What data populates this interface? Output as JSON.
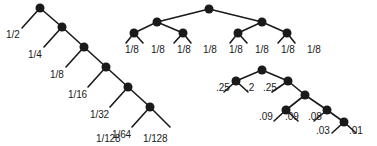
{
  "figure": {
    "name": "three-binary-code-trees-with-leaf-probabilities",
    "background_color": "#ffffff",
    "node_color": "#1a1a1a",
    "edge_color": "#1a1a1a",
    "text_color": "#1a1a1a",
    "width": 377,
    "height": 146
  },
  "trees": [
    {
      "id": "left-tree",
      "name": "unbalanced-skewed-tree",
      "nodes": [
        {
          "id": "L0",
          "x": 40,
          "y": 8,
          "r": 4.5
        },
        {
          "id": "L1",
          "x": 62,
          "y": 27,
          "r": 4.5
        },
        {
          "id": "L2",
          "x": 84,
          "y": 47,
          "r": 4.5
        },
        {
          "id": "L3",
          "x": 106,
          "y": 67,
          "r": 4.5
        },
        {
          "id": "L4",
          "x": 128,
          "y": 87,
          "r": 4.5
        },
        {
          "id": "L5",
          "x": 150,
          "y": 107,
          "r": 4.5
        }
      ],
      "edges": [
        {
          "from": "L0",
          "to": [
            22,
            28
          ]
        },
        {
          "from": "L0",
          "to": "L1"
        },
        {
          "from": "L1",
          "to": [
            44,
            47
          ]
        },
        {
          "from": "L1",
          "to": "L2"
        },
        {
          "from": "L2",
          "to": [
            66,
            67
          ]
        },
        {
          "from": "L2",
          "to": "L3"
        },
        {
          "from": "L3",
          "to": [
            88,
            87
          ]
        },
        {
          "from": "L3",
          "to": "L4"
        },
        {
          "from": "L4",
          "to": [
            110,
            107
          ]
        },
        {
          "from": "L4",
          "to": "L5"
        },
        {
          "from": "L5",
          "to": [
            132,
            127
          ]
        },
        {
          "from": "L5",
          "to": [
            170,
            127
          ]
        }
      ],
      "leaf_labels": [
        {
          "text": "1/2",
          "x": 6,
          "y": 29
        },
        {
          "text": "1/4",
          "x": 28,
          "y": 49
        },
        {
          "text": "1/8",
          "x": 50,
          "y": 69
        },
        {
          "text": "1/16",
          "x": 68,
          "y": 89
        },
        {
          "text": "1/32",
          "x": 90,
          "y": 109
        },
        {
          "text": "1/64",
          "x": 112,
          "y": 129
        },
        {
          "text": "1/128",
          "x": 96,
          "y": 133
        },
        {
          "text": "1/128",
          "x": 143,
          "y": 133
        }
      ]
    },
    {
      "id": "middle-tree",
      "name": "balanced-uniform-tree",
      "nodes": [
        {
          "id": "M0",
          "x": 209,
          "y": 9,
          "r": 4.5
        },
        {
          "id": "M1",
          "x": 157,
          "y": 22,
          "r": 4.5
        },
        {
          "id": "M2",
          "x": 262,
          "y": 22,
          "r": 4.5
        },
        {
          "id": "M3",
          "x": 134,
          "y": 33,
          "r": 4.5
        },
        {
          "id": "M4",
          "x": 183,
          "y": 33,
          "r": 4.5
        },
        {
          "id": "M5",
          "x": 238,
          "y": 33,
          "r": 4.5
        },
        {
          "id": "M6",
          "x": 287,
          "y": 33,
          "r": 4.5
        }
      ],
      "edges": [
        {
          "from": "M0",
          "to": "M1"
        },
        {
          "from": "M0",
          "to": "M2"
        },
        {
          "from": "M1",
          "to": "M3"
        },
        {
          "from": "M1",
          "to": "M4"
        },
        {
          "from": "M2",
          "to": "M5"
        },
        {
          "from": "M2",
          "to": "M6"
        },
        {
          "from": "M3",
          "to": [
            126,
            43
          ]
        },
        {
          "from": "M3",
          "to": [
            143,
            43
          ]
        },
        {
          "from": "M4",
          "to": [
            174,
            43
          ]
        },
        {
          "from": "M4",
          "to": [
            191,
            43
          ]
        },
        {
          "from": "M5",
          "to": [
            230,
            43
          ]
        },
        {
          "from": "M5",
          "to": [
            247,
            43
          ]
        },
        {
          "from": "M6",
          "to": [
            278,
            43
          ]
        },
        {
          "from": "M6",
          "to": [
            295,
            43
          ]
        }
      ],
      "leaf_labels": [
        {
          "text": "1/8",
          "x": 125,
          "y": 44
        },
        {
          "text": "1/8",
          "x": 151,
          "y": 44
        },
        {
          "text": "1/8",
          "x": 177,
          "y": 44
        },
        {
          "text": "1/8",
          "x": 203,
          "y": 44
        },
        {
          "text": "1/8",
          "x": 229,
          "y": 44
        },
        {
          "text": "1/8",
          "x": 255,
          "y": 44
        },
        {
          "text": "1/8",
          "x": 281,
          "y": 44
        },
        {
          "text": "1/8",
          "x": 307,
          "y": 44
        }
      ]
    },
    {
      "id": "right-tree",
      "name": "mixed-probability-tree",
      "nodes": [
        {
          "id": "R0",
          "x": 262,
          "y": 70,
          "r": 4.5
        },
        {
          "id": "R1",
          "x": 236,
          "y": 81,
          "r": 4.5
        },
        {
          "id": "R2",
          "x": 288,
          "y": 81,
          "r": 4.5
        },
        {
          "id": "R3",
          "x": 305,
          "y": 95,
          "r": 4.5
        },
        {
          "id": "R4",
          "x": 286,
          "y": 110,
          "r": 4.5
        },
        {
          "id": "R5",
          "x": 327,
          "y": 110,
          "r": 4.5
        },
        {
          "id": "R6",
          "x": 344,
          "y": 122,
          "r": 4.5
        }
      ],
      "edges": [
        {
          "from": "R0",
          "to": "R1"
        },
        {
          "from": "R0",
          "to": "R2"
        },
        {
          "from": "R1",
          "to": [
            224,
            92
          ]
        },
        {
          "from": "R1",
          "to": [
            248,
            92
          ]
        },
        {
          "from": "R2",
          "to": [
            272,
            92
          ]
        },
        {
          "from": "R2",
          "to": "R3"
        },
        {
          "from": "R3",
          "to": "R4"
        },
        {
          "from": "R3",
          "to": "R5"
        },
        {
          "from": "R4",
          "to": [
            274,
            121
          ]
        },
        {
          "from": "R4",
          "to": [
            298,
            121
          ]
        },
        {
          "from": "R5",
          "to": [
            314,
            121
          ]
        },
        {
          "from": "R5",
          "to": "R6"
        },
        {
          "from": "R6",
          "to": [
            332,
            133
          ]
        },
        {
          "from": "R6",
          "to": [
            356,
            133
          ]
        }
      ],
      "leaf_labels": [
        {
          "text": ".25",
          "x": 216,
          "y": 82
        },
        {
          "text": ".2",
          "x": 246,
          "y": 82
        },
        {
          "text": ".25",
          "x": 263,
          "y": 82
        },
        {
          "text": ".09",
          "x": 259,
          "y": 111
        },
        {
          "text": ".09",
          "x": 285,
          "y": 111
        },
        {
          "text": ".08",
          "x": 308,
          "y": 111
        },
        {
          "text": ".03",
          "x": 316,
          "y": 125
        },
        {
          "text": ".01",
          "x": 349,
          "y": 125
        }
      ]
    }
  ]
}
